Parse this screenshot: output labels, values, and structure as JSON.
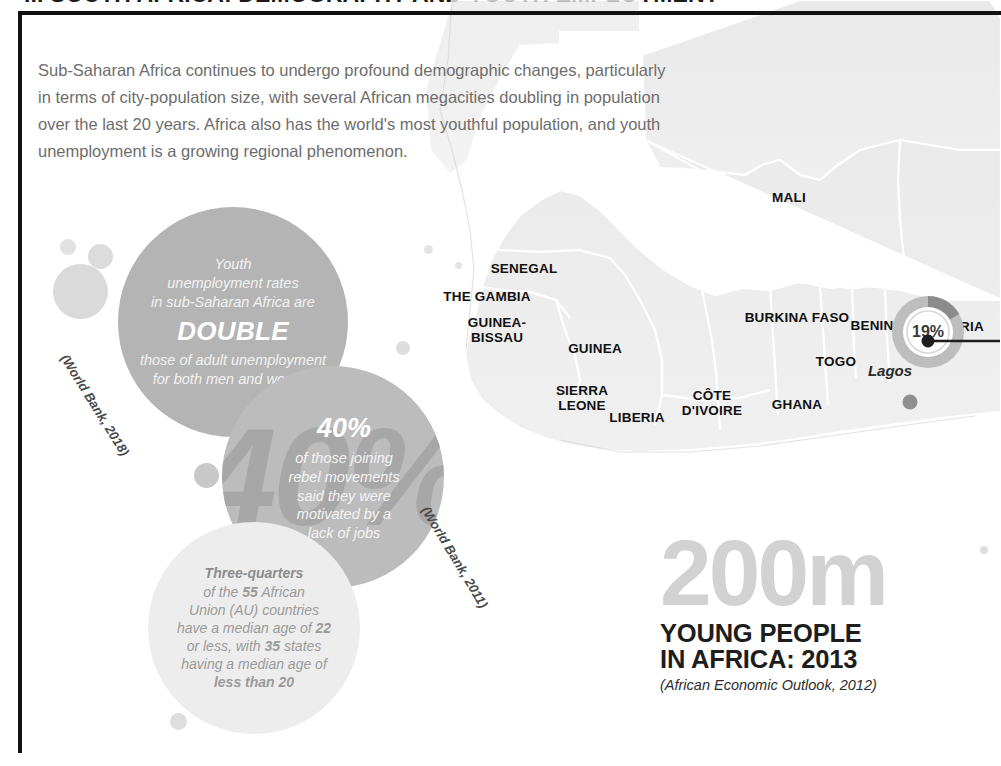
{
  "headline": "... SOUTH AFRICA: DEMOGRAPHY AND YOUTH EMPLOYMENT",
  "intro": {
    "paragraph": "Sub-Saharan Africa continues to undergo profound demographic changes, particularly in terms of city-population size, with several African megacities doubling in population over the last 20 years. Africa also has the world's most youthful population, and youth unemployment is a growing regional phenomenon."
  },
  "map": {
    "countries": [
      {
        "name": "MALI",
        "x": 789,
        "y": 197
      },
      {
        "name": "SENEGAL",
        "x": 524,
        "y": 268
      },
      {
        "name": "THE GAMBIA",
        "x": 487,
        "y": 296
      },
      {
        "name": "GUINEA-\nBISSAU",
        "x": 497,
        "y": 322
      },
      {
        "name": "GUINEA",
        "x": 595,
        "y": 348
      },
      {
        "name": "SIERRA\nLEONE",
        "x": 582,
        "y": 390
      },
      {
        "name": "LIBERIA",
        "x": 637,
        "y": 417
      },
      {
        "name": "CÔTE\nD'IVOIRE",
        "x": 712,
        "y": 395
      },
      {
        "name": "GHANA",
        "x": 797,
        "y": 404
      },
      {
        "name": "TOGO",
        "x": 836,
        "y": 361
      },
      {
        "name": "BENIN",
        "x": 872,
        "y": 325
      },
      {
        "name": "BURKINA FASO",
        "x": 797,
        "y": 317
      },
      {
        "name": "NIGERIA",
        "x": 955,
        "y": 326
      }
    ],
    "cities": [
      {
        "name": "Lagos",
        "label_x": 890,
        "label_y": 371,
        "dot_x": 910,
        "dot_y": 402
      }
    ],
    "markers": [
      {
        "name": "lagos-youth-unemployment",
        "value": "19%",
        "x": 928,
        "y": 332,
        "wedge_percent": 19
      }
    ]
  },
  "bubbles": [
    {
      "id": "double",
      "lines_before": [
        "Youth",
        "unemployment rates",
        "in sub-Saharan Africa are"
      ],
      "emphasis": "DOUBLE",
      "lines_after": [
        "those of adult unemployment",
        "for both men and women"
      ],
      "source": "(World Bank, 2018)"
    },
    {
      "id": "forty",
      "emphasis": "40%",
      "ghost": "40%",
      "lines_after": [
        "of those joining",
        "rebel movements",
        "said they were",
        "motivated by a",
        "lack of jobs"
      ],
      "source": "(World Bank, 2011)"
    },
    {
      "id": "quarters",
      "lead": "Three-quarters",
      "body_html": "of the <strong>55</strong> African\nUnion (AU) countries\nhave a median age of <strong>22</strong>\nor less, with <strong>35</strong> states\nhaving a median age of\n<strong>less than 20</strong>"
    }
  ],
  "bubble_double": {
    "line1": "Youth",
    "line2": "unemployment rates",
    "line3": "in sub-Saharan Africa are",
    "emphasis": "DOUBLE",
    "line4": "those of adult unemployment",
    "line5": "for both men and women",
    "source": "(World Bank, 2018)"
  },
  "bubble_forty": {
    "emphasis": "40%",
    "ghost": "40%",
    "line1": "of those joining",
    "line2": "rebel movements",
    "line3": "said they were",
    "line4": "motivated by a",
    "line5": "lack of jobs",
    "source": "(World Bank, 2011)"
  },
  "bubble_quarters": {
    "lead": "Three-quarters",
    "l1a": "of the ",
    "l1b": "55",
    "l1c": " African",
    "l2": "Union (AU) countries",
    "l3a": "have a median age of ",
    "l3b": "22",
    "l4a": "or less, with ",
    "l4b": "35",
    "l4c": " states",
    "l5": "having a median age of",
    "l6": "less than 20"
  },
  "big_stat": {
    "number": "200m",
    "caption": "YOUNG PEOPLE\nIN AFRICA: 2013",
    "source": "(African Economic Outlook, 2012)"
  },
  "colors": {
    "frame": "#111111",
    "bubble_dark": "#b4b4b4",
    "bubble_mid": "#bcbcbc",
    "bubble_light": "#ededed",
    "map_land": "#ececec",
    "map_border": "#ffffff",
    "big_number": "#d2d2d2",
    "body_text": "#6d6d6d",
    "marker_ring": "#bdbdbd",
    "marker_wedge": "#8b8b8b"
  }
}
